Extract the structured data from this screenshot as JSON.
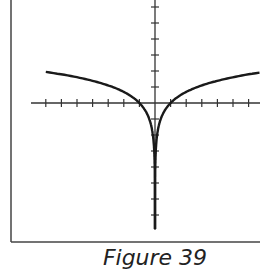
{
  "caption": "Figure 39",
  "colors": {
    "curve": "#1a1a1a",
    "axis": "#333333",
    "frame": "#444444"
  },
  "chart_data": {
    "type": "line",
    "title": "Figure 39",
    "function": "y = ln|x|",
    "xlabel": "",
    "ylabel": "",
    "xlim": [
      -8,
      6.7
    ],
    "ylim": [
      -8,
      6.5
    ],
    "grid": false,
    "legend": null,
    "x_ticks": [
      -7,
      -6,
      -5,
      -4,
      -3,
      -2,
      -1,
      1,
      2,
      3,
      4,
      5,
      6
    ],
    "y_ticks": [
      -7,
      -6,
      -5,
      -4,
      -3,
      -2,
      -1,
      1,
      2,
      3,
      4,
      5,
      6
    ],
    "series": [
      {
        "name": "left branch",
        "x": [
          -7,
          -6,
          -5,
          -4,
          -3,
          -2,
          -1,
          -0.5,
          -0.2,
          -0.05,
          -0.01,
          -0.001
        ],
        "values": [
          1.95,
          1.79,
          1.61,
          1.39,
          1.1,
          0.69,
          0,
          -0.69,
          -1.61,
          -3.0,
          -4.61,
          -6.9
        ]
      },
      {
        "name": "right branch",
        "x": [
          0.001,
          0.01,
          0.05,
          0.2,
          0.5,
          1,
          2,
          3,
          4,
          5,
          6,
          6.7
        ],
        "values": [
          -6.9,
          -4.61,
          -3.0,
          -1.61,
          -0.69,
          0,
          0.69,
          1.1,
          1.39,
          1.61,
          1.79,
          1.9
        ]
      }
    ]
  },
  "layout": {
    "origin": [
      155,
      103
    ],
    "px_per_unit_x": 15.6,
    "px_per_unit_y": 16,
    "x_axis_range_px": [
      31,
      260
    ],
    "y_axis_range_px": [
      0,
      230
    ],
    "frame": {
      "left": 11,
      "bottom": 242
    },
    "tick_half_len": 4
  }
}
